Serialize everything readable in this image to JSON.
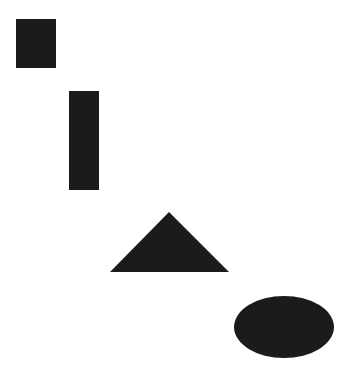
{
  "canvas": {
    "width": 356,
    "height": 378,
    "background_color": "#ffffff",
    "title": "Geometric Shapes"
  },
  "palette": {
    "shape_fill": "#1b1b1b",
    "background": "#ffffff"
  },
  "shapes": [
    {
      "id": "square",
      "name": "square",
      "label": "Square",
      "fill": "#1b1b1b",
      "x": 16,
      "y": 19,
      "width": 40,
      "height": 49,
      "center_x": 36,
      "center_y": 43.5
    },
    {
      "id": "vertical-rectangle",
      "name": "vertical-rectangle",
      "label": "Vertical Rectangle",
      "fill": "#1b1b1b",
      "x": 69,
      "y": 91,
      "width": 30,
      "height": 99,
      "center_x": 84,
      "center_y": 140.5
    },
    {
      "id": "triangle",
      "name": "triangle",
      "label": "Triangle",
      "fill": "#1b1b1b",
      "apex_x": 169,
      "apex_y": 212,
      "base_left_x": 110,
      "base_right_x": 229,
      "base_y": 272,
      "points": "169,212 229,272 110,272",
      "width": 119,
      "height": 60
    },
    {
      "id": "ellipse",
      "name": "ellipse",
      "label": "Ellipse",
      "fill": "#1b1b1b",
      "center_x": 284,
      "center_y": 327,
      "radius_x": 50,
      "radius_y": 31,
      "width": 100,
      "height": 62
    }
  ]
}
